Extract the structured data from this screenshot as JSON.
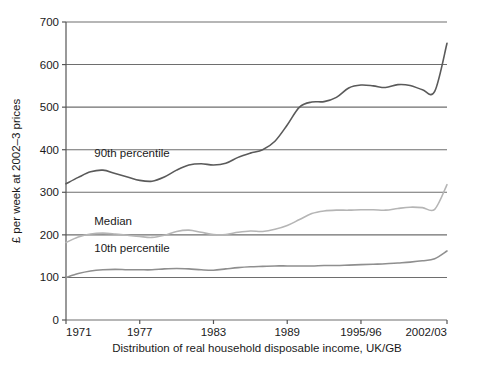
{
  "chart_data": {
    "type": "line",
    "title": "",
    "subtitle": "",
    "xlabel": "Distribution of real household disposable income, UK/GB",
    "ylabel": "£ per week at 2002–3 prices",
    "xlim": [
      1971,
      2002
    ],
    "ylim": [
      0,
      700
    ],
    "ytick_labels": [
      "0",
      "100",
      "200",
      "300",
      "400",
      "500",
      "600",
      "700"
    ],
    "ytick_values": [
      0,
      100,
      200,
      300,
      400,
      500,
      600,
      700
    ],
    "xtick_labels": [
      "1971",
      "1977",
      "1983",
      "1989",
      "1995/96",
      "2002/03"
    ],
    "xtick_values": [
      1971,
      1977,
      1983,
      1989,
      1995,
      2002
    ],
    "grid": "horizontal",
    "legend_position": "inline-annotations",
    "colors": {
      "p90": "#5a5a5a",
      "median": "#b5b5b5",
      "p10": "#8f8f8f",
      "axis": "#555555",
      "grid": "#6e6e6e",
      "background": "#ffffff"
    },
    "x": [
      1971,
      1972,
      1973,
      1974,
      1975,
      1976,
      1977,
      1978,
      1979,
      1980,
      1981,
      1982,
      1983,
      1984,
      1985,
      1986,
      1987,
      1988,
      1989,
      1990,
      1991,
      1992,
      1993,
      1994,
      1995,
      1996,
      1997,
      1998,
      1999,
      2000,
      2001,
      2002
    ],
    "series": [
      {
        "name": "90th percentile",
        "color": "#5a5a5a",
        "label_x": 1973.3,
        "label_y": 392,
        "values": [
          320,
          335,
          348,
          352,
          344,
          336,
          328,
          326,
          336,
          352,
          364,
          367,
          364,
          368,
          382,
          392,
          400,
          420,
          458,
          500,
          512,
          513,
          523,
          545,
          552,
          550,
          546,
          553,
          551,
          541,
          537,
          650
        ]
      },
      {
        "name": "Median",
        "color": "#b5b5b5",
        "label_x": 1973.3,
        "label_y": 232,
        "values": [
          182,
          195,
          202,
          204,
          202,
          199,
          196,
          194,
          199,
          208,
          211,
          206,
          201,
          201,
          206,
          209,
          208,
          213,
          222,
          236,
          250,
          256,
          258,
          258,
          259,
          259,
          258,
          262,
          265,
          264,
          260,
          318
        ]
      },
      {
        "name": "10th percentile",
        "color": "#8f8f8f",
        "label_x": 1973.3,
        "label_y": 168,
        "values": [
          100,
          109,
          115,
          118,
          119,
          118,
          118,
          118,
          120,
          121,
          120,
          118,
          117,
          120,
          123,
          125,
          126,
          127,
          127,
          127,
          127,
          128,
          128,
          129,
          130,
          131,
          132,
          134,
          136,
          139,
          144,
          162
        ]
      }
    ],
    "series_detail_note": "three percentile lines of real household disposable income"
  },
  "axis": {
    "y_title": "£ per week at 2002–3 prices",
    "x_title": "Distribution of real household disposable income, UK/GB"
  }
}
